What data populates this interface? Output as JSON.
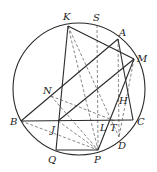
{
  "diagram": {
    "type": "geometry",
    "colors": {
      "line": "#2a2a2a",
      "dashed": "#555555",
      "background": "#ffffff"
    },
    "circle": {
      "cx": 79,
      "cy": 89,
      "r": 66
    },
    "points": {
      "K": {
        "x": 68,
        "y": 26,
        "label": "K",
        "lx": 63,
        "ly": 20
      },
      "S": {
        "x": 97,
        "y": 25,
        "label": "S",
        "lx": 93,
        "ly": 21
      },
      "A": {
        "x": 118,
        "y": 39,
        "label": "A",
        "lx": 119,
        "ly": 36
      },
      "M": {
        "x": 134,
        "y": 59,
        "label": "M",
        "lx": 137,
        "ly": 62
      },
      "C": {
        "x": 133,
        "y": 120,
        "label": "C",
        "lx": 137,
        "ly": 125
      },
      "D": {
        "x": 119,
        "y": 137,
        "label": "D",
        "lx": 118,
        "ly": 149
      },
      "P": {
        "x": 98,
        "y": 150,
        "label": "P",
        "lx": 94,
        "ly": 163
      },
      "Q": {
        "x": 56,
        "y": 150,
        "label": "Q",
        "lx": 48,
        "ly": 163
      },
      "B": {
        "x": 21,
        "y": 121,
        "label": "B",
        "lx": 10,
        "ly": 125
      },
      "N": {
        "x": 51,
        "y": 96,
        "label": "N",
        "lx": 43,
        "ly": 94
      },
      "J": {
        "x": 58,
        "y": 121,
        "label": "J",
        "lx": 51,
        "ly": 133
      },
      "L": {
        "x": 108,
        "y": 121,
        "label": "L",
        "lx": 100,
        "ly": 131
      },
      "T": {
        "x": 115,
        "y": 121,
        "label": "T",
        "lx": 110,
        "ly": 131
      },
      "H": {
        "x": 120,
        "y": 104,
        "label": "H",
        "lx": 119,
        "ly": 104
      }
    },
    "solid_segments": [
      [
        "B",
        "C"
      ],
      [
        "B",
        "A"
      ],
      [
        "K",
        "M"
      ],
      [
        "K",
        "Q"
      ],
      [
        "A",
        "C"
      ],
      [
        "J",
        "M"
      ],
      [
        "P",
        "M"
      ],
      [
        "Q",
        "P"
      ]
    ],
    "dashed_segments": [
      [
        "K",
        "P"
      ],
      [
        "S",
        "P"
      ],
      [
        "N",
        "P"
      ],
      [
        "B",
        "P"
      ],
      [
        "A",
        "D"
      ],
      [
        "M",
        "D"
      ],
      [
        "K",
        "D"
      ],
      [
        "N",
        "T"
      ],
      [
        "J",
        "P"
      ]
    ]
  }
}
